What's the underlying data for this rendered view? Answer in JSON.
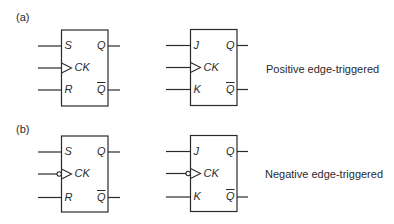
{
  "colors": {
    "line": "#2a2a2a",
    "background": "#ffffff"
  },
  "parts": [
    {
      "label": "(a)",
      "label_pos": [
        16,
        12
      ],
      "caption": "Positive edge-triggered",
      "caption_pos": [
        266,
        63
      ],
      "flipflops": [
        {
          "type": "SR",
          "box": [
            61.5,
            30,
            46.5,
            76
          ],
          "lead_left_x": 38,
          "lead_right_x": 120,
          "rows_y": [
            46,
            68,
            90
          ],
          "inputs": [
            "S",
            "CK",
            "R"
          ],
          "outputs": [
            "Q",
            "Q"
          ],
          "negative_clock": false
        },
        {
          "type": "JK",
          "box": [
            190.5,
            29.5,
            46.5,
            76
          ],
          "lead_left_x": 166,
          "lead_right_x": 248,
          "rows_y": [
            45.5,
            67.5,
            89.5
          ],
          "inputs": [
            "J",
            "CK",
            "K"
          ],
          "outputs": [
            "Q",
            "Q"
          ],
          "negative_clock": false
        }
      ]
    },
    {
      "label": "(b)",
      "label_pos": [
        16,
        124
      ],
      "caption": "Negative edge-triggered",
      "caption_pos": [
        265,
        168
      ],
      "flipflops": [
        {
          "type": "SR",
          "box": [
            61.5,
            136,
            46.5,
            76
          ],
          "lead_left_x": 38,
          "lead_right_x": 120,
          "rows_y": [
            152,
            174,
            197.5
          ],
          "inputs": [
            "S",
            "CK",
            "R"
          ],
          "outputs": [
            "Q",
            "Q"
          ],
          "negative_clock": true
        },
        {
          "type": "JK",
          "box": [
            190.5,
            135.5,
            46.5,
            76
          ],
          "lead_left_x": 166,
          "lead_right_x": 248,
          "rows_y": [
            151.5,
            173.5,
            197
          ],
          "inputs": [
            "J",
            "CK",
            "K"
          ],
          "outputs": [
            "Q",
            "Q"
          ],
          "negative_clock": true
        }
      ]
    }
  ],
  "legend": {
    "output_q": "Q",
    "output_qbar": "Q̅ (complement)"
  }
}
